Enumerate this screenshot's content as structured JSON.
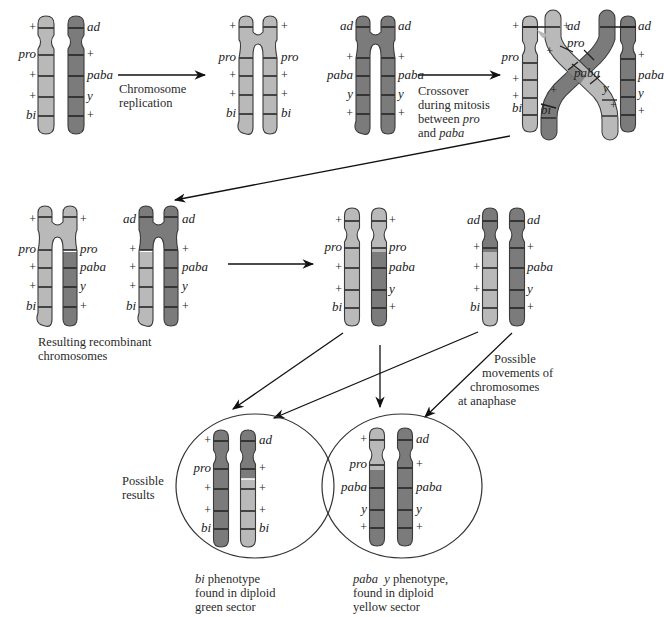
{
  "colors": {
    "light": "#b9b9b9",
    "dark": "#7b7b7b",
    "outline": "#3a3a3a",
    "band": "#1e1e1e",
    "text": "#222222",
    "background": "#ffffff"
  },
  "captions": {
    "replication": [
      "Chromosome",
      "replication"
    ],
    "crossover": [
      "Crossover",
      "during mitosis",
      "between ",
      "pro",
      "and ",
      "paba"
    ],
    "recombinant": [
      "Resulting recombinant",
      "chromosomes"
    ],
    "anaphase": [
      "Possible",
      "movements of",
      "chromosomes",
      "at anaphase"
    ],
    "possible_results": [
      "Possible",
      "results"
    ],
    "result_left": [
      "bi",
      " phenotype",
      "found in diploid",
      "green sector"
    ],
    "result_right": [
      "paba  y",
      " phenotype,",
      "found in diploid",
      "yellow sector"
    ]
  },
  "stages": {
    "s1_parental": {
      "left_chromosome": {
        "color": "light",
        "labels_left": [
          "+",
          "pro",
          "+",
          "+",
          "bi"
        ]
      },
      "right_chromosome": {
        "color": "dark",
        "labels_right": [
          "ad",
          "+",
          "paba",
          "y",
          "+"
        ]
      }
    },
    "s2_replicated": {
      "light_chromosome": {
        "labels_left": [
          "+",
          "pro",
          "+",
          "+",
          "bi"
        ],
        "labels_right": [
          "+",
          "pro",
          "+",
          "+",
          "bi"
        ]
      },
      "dark_chromosome": {
        "labels_left": [
          "ad",
          "+",
          "paba",
          "y",
          "+"
        ],
        "labels_right": [
          "ad",
          "+",
          "paba",
          "y",
          "+"
        ]
      }
    },
    "s3_crossover": {
      "labels": [
        "+",
        "+",
        "ad",
        "ad",
        "pro",
        "pro",
        "+",
        "+",
        "+",
        "paba",
        "paba",
        "+",
        "+",
        "y",
        "y",
        "bi",
        "bi",
        "+",
        "+"
      ]
    },
    "s4_recombinant": {
      "light_chromosome": {
        "labels_left": [
          "+",
          "pro",
          "+",
          "+",
          "bi"
        ],
        "labels_right": [
          "+",
          "pro",
          "paba",
          "y",
          "+"
        ]
      },
      "dark_chromosome": {
        "labels_left": [
          "ad",
          "+",
          "+",
          "+",
          "bi"
        ],
        "labels_right": [
          "ad",
          "+",
          "paba",
          "y",
          "+"
        ]
      }
    },
    "s5_separated": {
      "pair_a": {
        "left_labels": [
          "+",
          "pro",
          "+",
          "+",
          "bi"
        ],
        "right_labels": [
          "+",
          "pro",
          "paba",
          "y",
          "+"
        ]
      },
      "pair_b": {
        "left_labels": [
          "ad",
          "+",
          "+",
          "+",
          "bi"
        ],
        "right_labels": [
          "ad",
          "+",
          "paba",
          "y",
          "+"
        ]
      }
    },
    "result_left": {
      "left_labels": [
        "+",
        "pro",
        "+",
        "+",
        "bi"
      ],
      "right_labels": [
        "ad",
        "+",
        "+",
        "+",
        "bi"
      ]
    },
    "result_right": {
      "left_labels": [
        "+",
        "pro",
        "paba",
        "y",
        "+"
      ],
      "right_labels": [
        "ad",
        "+",
        "paba",
        "y",
        "+"
      ]
    }
  }
}
